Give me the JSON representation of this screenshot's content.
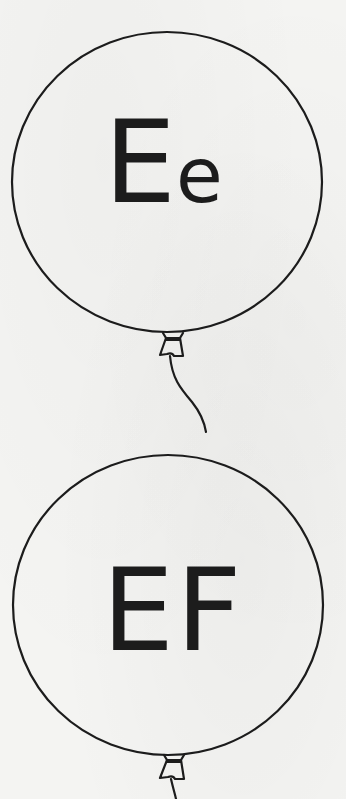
{
  "worksheet": {
    "balloons": [
      {
        "label_upper": "E",
        "label_lower": "e",
        "display": "Ee"
      },
      {
        "label_upper": "EF",
        "display": "EF"
      }
    ]
  },
  "colors": {
    "ink": "#1c1c1c",
    "paper": "#f4f4f2"
  }
}
